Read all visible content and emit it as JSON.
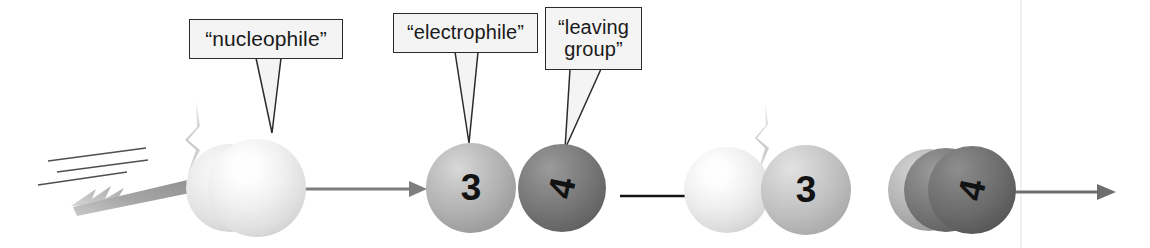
{
  "figure": {
    "kind": "reaction-scheme-cartoon",
    "background_color": "#ffffff",
    "canvas": {
      "width": 1150,
      "height": 248
    }
  },
  "callouts": [
    {
      "id": "nucleophile",
      "text": "“nucleophile”",
      "points_to": "incoming-pale-sphere",
      "box": {
        "x": 189,
        "y": 19,
        "w": 154,
        "h": 40
      },
      "tail_tip": {
        "x": 272,
        "y": 133
      }
    },
    {
      "id": "electrophile",
      "text": "“electrophile”",
      "points_to": "sphere-3-reactant",
      "box": {
        "x": 393,
        "y": 13,
        "w": 145,
        "h": 40
      },
      "tail_tip": {
        "x": 469,
        "y": 143
      }
    },
    {
      "id": "leaving-group",
      "text": "“leaving\ngroup”",
      "points_to": "sphere-4-reactant",
      "box": {
        "x": 545,
        "y": 7,
        "w": 97,
        "h": 63
      },
      "tail_tip": {
        "x": 565,
        "y": 149
      }
    }
  ],
  "atoms": [
    {
      "id": "nucleophile-back",
      "label": "",
      "shade": "pale2",
      "cx": 230,
      "cy": 188,
      "r": 44
    },
    {
      "id": "nucleophile-front",
      "label": "",
      "shade": "pale",
      "cx": 257,
      "cy": 188,
      "r": 49
    },
    {
      "id": "sphere-3-reactant",
      "label": "3",
      "shade": "mid",
      "cx": 471,
      "cy": 188,
      "r": 45
    },
    {
      "id": "sphere-4-reactant",
      "label": "4",
      "shade": "dark",
      "cx": 562,
      "cy": 188,
      "r": 44
    },
    {
      "id": "sphere-nuc-product",
      "label": "",
      "shade": "pale",
      "cx": 727,
      "cy": 190,
      "r": 43
    },
    {
      "id": "sphere-3-product",
      "label": "3",
      "shade": "midlight",
      "cx": 806,
      "cy": 190,
      "r": 45
    },
    {
      "id": "lg-back",
      "label": "",
      "shade": "mid",
      "cx": 929,
      "cy": 190,
      "r": 41
    },
    {
      "id": "lg-middle",
      "label": "",
      "shade": "dark",
      "cx": 946,
      "cy": 190,
      "r": 42
    },
    {
      "id": "sphere-4-product",
      "label": "4",
      "shade": "darker",
      "cx": 972,
      "cy": 190,
      "r": 44
    }
  ],
  "arrows": [
    {
      "id": "reaction-arrow-1",
      "color": "#7d7d7d",
      "x1": 305,
      "y1": 189,
      "x2": 424,
      "y2": 189
    },
    {
      "id": "reaction-arrow-2",
      "color": "#141414",
      "x1": 620,
      "y1": 196,
      "x2": 700,
      "y2": 196
    },
    {
      "id": "reaction-arrow-3",
      "color": "#6e6e6e",
      "x1": 1013,
      "y1": 192,
      "x2": 1113,
      "y2": 192
    }
  ],
  "dart": {
    "id": "incoming-dart",
    "description": "flying dart projectile with motion speed lines",
    "motion_lines": 3,
    "color_shaft": "#9a9a9a",
    "color_tip": "#4a4a4a"
  },
  "wisps": [
    {
      "id": "wisp-left",
      "x": 176,
      "y": 100
    },
    {
      "id": "wisp-right",
      "x": 757,
      "y": 100
    }
  ],
  "scan_line": {
    "id": "page-scan-line",
    "x": 1021,
    "color": "#f0f0f0"
  }
}
